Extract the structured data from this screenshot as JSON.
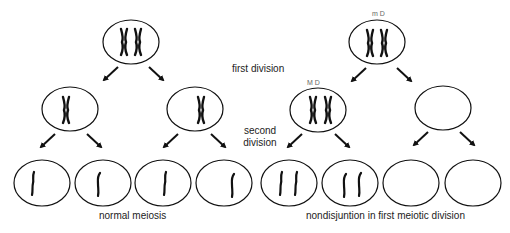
{
  "labels": {
    "first_division": "first division",
    "second_division_line1": "second",
    "second_division_line2": "division",
    "normal_meiosis": "normal meiosis",
    "nondisjunction": "nondisjuntion in first meiotic division"
  },
  "annotations": {
    "top_right_cell": "m  D",
    "middle_left_nondisjunction_cell": "M  D"
  },
  "colors": {
    "stroke": "#111111",
    "text": "#222222",
    "background": "#ffffff"
  },
  "panels": [
    {
      "name": "normal meiosis",
      "parent": {
        "chromosomes": "2 replicated (X-shaped)"
      },
      "first_division_products": [
        {
          "chromosomes": "1 replicated"
        },
        {
          "chromosomes": "1 replicated"
        }
      ],
      "gametes": [
        {
          "chromosomes": 1
        },
        {
          "chromosomes": 1
        },
        {
          "chromosomes": 1
        },
        {
          "chromosomes": 1
        }
      ]
    },
    {
      "name": "nondisjuntion in first meiotic division",
      "parent": {
        "chromosomes": "2 replicated (X-shaped)"
      },
      "first_division_products": [
        {
          "chromosomes": "2 replicated"
        },
        {
          "chromosomes": "0"
        }
      ],
      "gametes": [
        {
          "chromosomes": 2
        },
        {
          "chromosomes": 2
        },
        {
          "chromosomes": 0
        },
        {
          "chromosomes": 0
        }
      ]
    }
  ]
}
